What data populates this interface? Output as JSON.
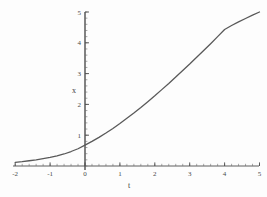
{
  "figure": {
    "background_color": "#fdfdfd",
    "curve_color": "#595959",
    "axis_color": "#4d4d4d",
    "tick_color": "#6b6b6b",
    "label_color": "#4a4a4a"
  },
  "chart_data": {
    "type": "line",
    "title": "",
    "xlabel": "t",
    "ylabel": "x",
    "xlim": [
      -2,
      5
    ],
    "ylim": [
      0,
      5
    ],
    "grid": false,
    "legend": null,
    "x_ticks": [
      -2,
      -1,
      0,
      1,
      2,
      3,
      4,
      5
    ],
    "x_tick_labels": [
      "-2",
      "-1",
      "0",
      "1",
      "2",
      "3",
      "4",
      "5"
    ],
    "x_minor_tick_step": 0.2,
    "y_ticks": [
      1,
      2,
      3,
      4,
      5
    ],
    "y_tick_labels": [
      "1",
      "2",
      "3",
      "4",
      "5"
    ],
    "y_minor_tick_step": 0.2,
    "series": [
      {
        "name": "x(t)",
        "x": [
          -2.0,
          -1.8,
          -1.6,
          -1.4,
          -1.2,
          -1.0,
          -0.8,
          -0.6,
          -0.4,
          -0.2,
          0.0,
          0.2,
          0.4,
          0.6,
          0.8,
          1.0,
          1.2,
          1.4,
          1.6,
          1.8,
          2.0,
          2.2,
          2.4,
          2.6,
          2.8,
          3.0,
          3.2,
          3.4,
          3.6,
          3.8,
          4.0,
          4.2,
          4.4,
          4.6,
          4.8,
          5.0
        ],
        "y": [
          0.12,
          0.14,
          0.17,
          0.2,
          0.24,
          0.28,
          0.33,
          0.39,
          0.47,
          0.56,
          0.68,
          0.8,
          0.93,
          1.07,
          1.22,
          1.38,
          1.55,
          1.72,
          1.9,
          2.09,
          2.28,
          2.48,
          2.68,
          2.89,
          3.1,
          3.31,
          3.53,
          3.75,
          3.97,
          4.2,
          4.43,
          4.56,
          4.68,
          4.79,
          4.9,
          5.0
        ]
      }
    ]
  }
}
